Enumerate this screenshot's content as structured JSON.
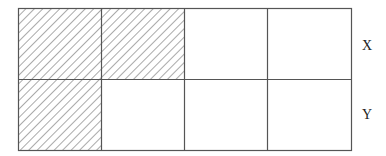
{
  "diagram": {
    "type": "grid",
    "rows": 2,
    "cols": 4,
    "row_labels": [
      "X",
      "Y"
    ],
    "cells": [
      [
        {
          "shaded": true
        },
        {
          "shaded": true
        },
        {
          "shaded": false
        },
        {
          "shaded": false
        }
      ],
      [
        {
          "shaded": true
        },
        {
          "shaded": false
        },
        {
          "shaded": false
        },
        {
          "shaded": false
        }
      ]
    ],
    "colors": {
      "line": "#555555",
      "hatch": "#555555",
      "background": "#ffffff"
    }
  }
}
